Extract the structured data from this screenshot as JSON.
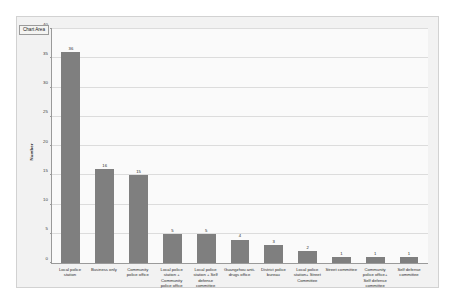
{
  "tooltip": {
    "label": "Chart Area"
  },
  "chart_data": {
    "type": "bar",
    "title": "",
    "xlabel": "",
    "ylabel": "Number",
    "ylim": [
      0,
      40
    ],
    "ytick_step": 5,
    "yticks": [
      0,
      5,
      10,
      15,
      20,
      25,
      30,
      35,
      40
    ],
    "grid": true,
    "legend": false,
    "bar_color": "#7f7f7f",
    "plot_background": "#fafafa",
    "chart_background": "#f2f2f2",
    "show_data_labels": true,
    "categories": [
      "Local police station",
      "Business only",
      "Community police office",
      "Local police station + Community police office",
      "Local police station + Self defense committee",
      "Guangzhou anti-drugs office",
      "District police bureau",
      "Local police station+ Street Committee",
      "Street committee",
      "Community police office+ Self defense committee",
      "Self defense committee"
    ],
    "values": [
      36,
      16,
      15,
      5,
      5,
      4,
      3,
      2,
      1,
      1,
      1
    ]
  }
}
